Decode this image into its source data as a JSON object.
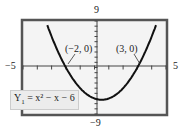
{
  "chart_data": {
    "type": "line",
    "title": "",
    "equation": "Y1 = x^2 - x - 6",
    "xlim": [
      -5,
      5
    ],
    "ylim": [
      -9,
      9
    ],
    "xscale": 1,
    "yscale": 1,
    "grid": false,
    "series": [
      {
        "name": "Y1 = x^2 - x - 6",
        "x": [
          -3,
          -2.5,
          -2,
          -1.5,
          -1,
          -0.5,
          0,
          0.5,
          1,
          1.5,
          2,
          2.5,
          3,
          3.5,
          4
        ],
        "y": [
          6,
          2.75,
          0,
          -2.25,
          -4,
          -5.25,
          -6,
          -6.25,
          -6,
          -5.25,
          -4,
          -2.25,
          0,
          2.75,
          6
        ]
      }
    ],
    "annotations": [
      {
        "text": "(-2, 0)",
        "x": -2,
        "y": 0
      },
      {
        "text": "(3, 0)",
        "x": 3,
        "y": 0
      }
    ]
  },
  "labels": {
    "ymax": "9",
    "ymin": "−9",
    "xmin": "−5",
    "xmax": "5",
    "root1": "(−2, 0)",
    "root2": "(3, 0)",
    "equation_prefix": "Y",
    "equation_sub": "1",
    "equation_body": " = x² − x − 6"
  },
  "colors": {
    "frame": "#555555",
    "plot_bg": "#f4f4f4",
    "curve": "#111111"
  }
}
